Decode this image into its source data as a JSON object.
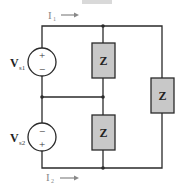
{
  "diagram": {
    "type": "circuit",
    "top_bar_color": "#d9d9d9",
    "wire_color": "#2a2a2a",
    "impedance_fill": "#c8c8c8",
    "current_label_color": "#888888",
    "currents": [
      {
        "label": "I",
        "sub": "1",
        "direction": "right"
      },
      {
        "label": "I",
        "sub": "2",
        "direction": "right"
      }
    ],
    "sources": [
      {
        "label": "V",
        "sub": "s1",
        "top_sign": "+",
        "bottom_sign": "−"
      },
      {
        "label": "V",
        "sub": "s2",
        "top_sign": "−",
        "bottom_sign": "+"
      }
    ],
    "impedances": [
      {
        "label": "Z"
      },
      {
        "label": "Z"
      },
      {
        "label": "Z"
      }
    ]
  }
}
